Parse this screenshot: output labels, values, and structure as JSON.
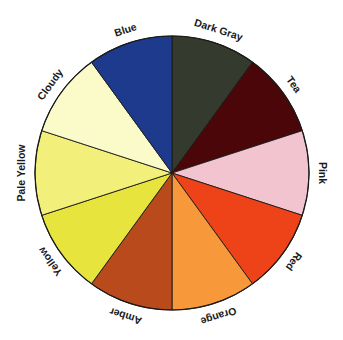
{
  "diagram": {
    "type": "color-wheel",
    "segment_count": 10,
    "order": "clockwise from 12 o'clock",
    "segments": [
      {
        "label": "Dark Gray",
        "color": "#353a2e"
      },
      {
        "label": "Tea",
        "color": "#4a0608"
      },
      {
        "label": "Pink",
        "color": "#f2c4d0"
      },
      {
        "label": "Red",
        "color": "#ee4218"
      },
      {
        "label": "Orange",
        "color": "#f7983a"
      },
      {
        "label": "Amber",
        "color": "#b84a1c"
      },
      {
        "label": "Yellow",
        "color": "#e8e43e"
      },
      {
        "label": "Pale Yellow",
        "color": "#f2f07a"
      },
      {
        "label": "Cloudy",
        "color": "#fafbc8"
      },
      {
        "label": "Blue",
        "color": "#1e3a8c"
      }
    ]
  }
}
